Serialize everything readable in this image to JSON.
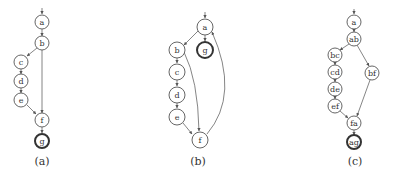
{
  "figure": {
    "panels": [
      {
        "id": "a",
        "caption": "(a)",
        "nodes": [
          {
            "id": "a",
            "label": "a",
            "x": 42,
            "y": 22,
            "final": false
          },
          {
            "id": "b",
            "label": "b",
            "x": 42,
            "y": 43,
            "final": false
          },
          {
            "id": "c",
            "label": "c",
            "x": 21,
            "y": 62,
            "final": false
          },
          {
            "id": "d",
            "label": "d",
            "x": 21,
            "y": 81,
            "final": false
          },
          {
            "id": "e",
            "label": "e",
            "x": 21,
            "y": 100,
            "final": false
          },
          {
            "id": "f",
            "label": "f",
            "x": 42,
            "y": 120,
            "final": false
          },
          {
            "id": "g",
            "label": "g",
            "x": 42,
            "y": 141,
            "final": true
          }
        ],
        "edges": [
          [
            "a",
            "b"
          ],
          [
            "b",
            "c"
          ],
          [
            "c",
            "d"
          ],
          [
            "d",
            "e"
          ],
          [
            "e",
            "f"
          ],
          [
            "b",
            "f"
          ],
          [
            "f",
            "g"
          ]
        ]
      },
      {
        "id": "b",
        "caption": "(b)",
        "nodes": [
          {
            "id": "a",
            "label": "a",
            "x": 205,
            "y": 27,
            "final": false
          },
          {
            "id": "g",
            "label": "g",
            "x": 205,
            "y": 50,
            "final": true
          },
          {
            "id": "b",
            "label": "b",
            "x": 177,
            "y": 50,
            "final": false
          },
          {
            "id": "c",
            "label": "c",
            "x": 177,
            "y": 72,
            "final": false
          },
          {
            "id": "d",
            "label": "d",
            "x": 177,
            "y": 95,
            "final": false
          },
          {
            "id": "e",
            "label": "e",
            "x": 177,
            "y": 117,
            "final": false
          },
          {
            "id": "f",
            "label": "f",
            "x": 200,
            "y": 140,
            "final": false
          }
        ],
        "edges": [
          [
            "a",
            "b"
          ],
          [
            "a",
            "g"
          ],
          [
            "b",
            "c"
          ],
          [
            "c",
            "d"
          ],
          [
            "d",
            "e"
          ],
          [
            "e",
            "f"
          ],
          [
            "b",
            "f"
          ],
          [
            "f",
            "a"
          ]
        ]
      },
      {
        "id": "c",
        "caption": "(c)",
        "nodes": [
          {
            "id": "a",
            "label": "a",
            "x": 354,
            "y": 22,
            "final": false
          },
          {
            "id": "ab",
            "label": "ab",
            "x": 354,
            "y": 39,
            "final": false
          },
          {
            "id": "bc",
            "label": "bc",
            "x": 335,
            "y": 55,
            "final": false
          },
          {
            "id": "cd",
            "label": "cd",
            "x": 335,
            "y": 72,
            "final": false
          },
          {
            "id": "de",
            "label": "de",
            "x": 335,
            "y": 89,
            "final": false
          },
          {
            "id": "ef",
            "label": "ef",
            "x": 335,
            "y": 106,
            "final": false
          },
          {
            "id": "bf",
            "label": "bf",
            "x": 372,
            "y": 73,
            "final": false
          },
          {
            "id": "fa",
            "label": "fa",
            "x": 354,
            "y": 123,
            "final": false
          },
          {
            "id": "ag",
            "label": "ag",
            "x": 354,
            "y": 142,
            "final": true
          }
        ],
        "edges": [
          [
            "a",
            "ab"
          ],
          [
            "ab",
            "bc"
          ],
          [
            "bc",
            "cd"
          ],
          [
            "cd",
            "de"
          ],
          [
            "de",
            "ef"
          ],
          [
            "ef",
            "fa"
          ],
          [
            "ab",
            "bf"
          ],
          [
            "bf",
            "fa"
          ],
          [
            "fa",
            "ag"
          ]
        ]
      }
    ]
  }
}
